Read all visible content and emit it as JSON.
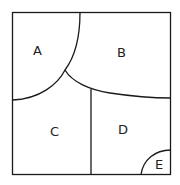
{
  "diagram": {
    "type": "map-regions",
    "regions": [
      {
        "id": "A",
        "label": "A"
      },
      {
        "id": "B",
        "label": "B"
      },
      {
        "id": "C",
        "label": "C"
      },
      {
        "id": "D",
        "label": "D"
      },
      {
        "id": "E",
        "label": "E"
      }
    ],
    "stroke_color": "#1a1a1a",
    "background": "#ffffff"
  }
}
